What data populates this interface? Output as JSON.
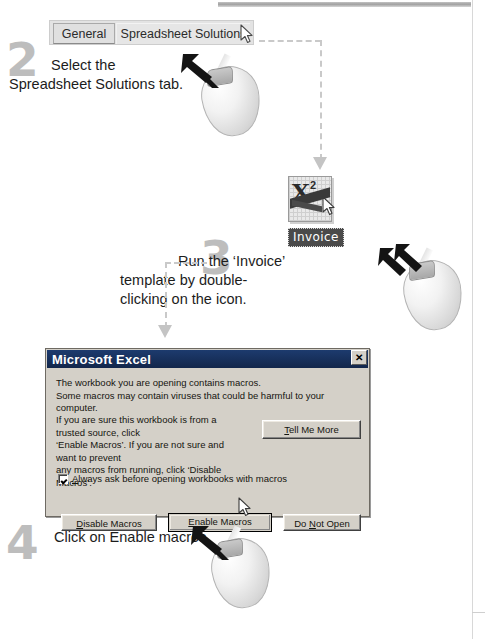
{
  "page": {
    "top_bar": "decorative-gray-bar",
    "margin_rule": "page-margin-line"
  },
  "tabs": {
    "items": [
      {
        "label": "General",
        "selected": false
      },
      {
        "label": "Spreadsheet Solutions",
        "selected": true
      }
    ]
  },
  "steps": [
    {
      "number": "2",
      "text": "Select the\nSpreadsheet Solutions tab.",
      "mouse_hint": "single-click"
    },
    {
      "number": "3",
      "text": "Run the ‘Invoice’\ntemplate by double-\nclicking on the icon.",
      "mouse_hint": "double-click"
    },
    {
      "number": "4",
      "text": "Click on Enable macros.",
      "mouse_hint": "single-click"
    }
  ],
  "invoice_icon": {
    "label": "Invoice",
    "glyph": "X",
    "superscript": "2"
  },
  "dialog": {
    "title": "Microsoft Excel",
    "close_label": "✕",
    "paragraph1": "The workbook you are opening contains macros.\nSome macros may contain viruses that could be harmful to your computer.",
    "paragraph2": "If you are sure this workbook is from a trusted source, click\n‘Enable Macros’. If you are not sure and want to prevent\nany macros from running, click ‘Disable Macros’.",
    "tell_me_more": {
      "pre": "T",
      "post": "ell Me More"
    },
    "checkbox": {
      "checked": true,
      "pre": "A",
      "post": "lways ask before opening workbooks with macros"
    },
    "buttons": [
      {
        "name": "disable-macros",
        "pre": "D",
        "post": "isable Macros",
        "default": false
      },
      {
        "name": "enable-macros",
        "pre": "E",
        "post": "nable Macros",
        "default": true
      },
      {
        "name": "do-not-open",
        "lead": "Do ",
        "pre": "N",
        "post": "ot Open",
        "default": false
      }
    ]
  },
  "colors": {
    "dialog_face": "#d4d0c8",
    "titlebar": "#12264b",
    "step_number": "#bdbdbd",
    "connector": "#c9c9c9",
    "invoice_label_bg": "#4a4a4a"
  }
}
